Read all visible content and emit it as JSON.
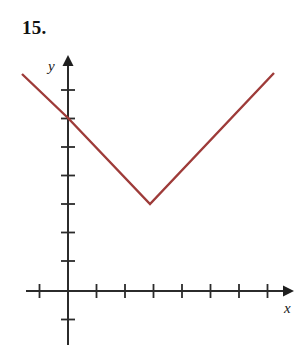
{
  "figure": {
    "problem_number": "15.",
    "background_color": "#ffffff"
  },
  "axes": {
    "x_axis_label": "x",
    "y_axis_label": "y",
    "axis_color": "#2b2b2b",
    "tick_color": "#2b2b2b",
    "origin_px": {
      "x": 68,
      "y": 291
    },
    "unit_px": 28.5,
    "x_ticks_units": [
      -1,
      1,
      2,
      3,
      4,
      5,
      6,
      7,
      8
    ],
    "y_ticks_units": [
      -1,
      1,
      2,
      3,
      4,
      5,
      6,
      7
    ],
    "x_axis_start_px": 26,
    "x_axis_end_px": 291,
    "y_axis_top_px": 58,
    "y_axis_bottom_px": 345,
    "grid": "off",
    "tick_labels": "none"
  },
  "chart_data": {
    "type": "line",
    "title": "",
    "subtitle": "",
    "xlabel": "x",
    "ylabel": "y",
    "xlim": [
      -1.5,
      8
    ],
    "ylim": [
      -2,
      8.2
    ],
    "grid": false,
    "legend": "none",
    "annotations": [
      "15."
    ],
    "series": [
      {
        "name": "absolute-value-v-graph",
        "color": "#9e3b39",
        "line_width_px": 2.4,
        "x": [
          -1.6,
          0,
          3,
          7.2
        ],
        "y": [
          7.6,
          6,
          3,
          7.65
        ],
        "points_px": [
          {
            "x": 22,
            "y": 74
          },
          {
            "x": 68,
            "y": 118
          },
          {
            "x": 150,
            "y": 204
          },
          {
            "x": 274,
            "y": 73
          }
        ],
        "vertex_units": {
          "x": 3,
          "y": 3
        },
        "y_intercept_units": 6,
        "left_slope": -1,
        "right_slope": 1.1
      }
    ]
  }
}
